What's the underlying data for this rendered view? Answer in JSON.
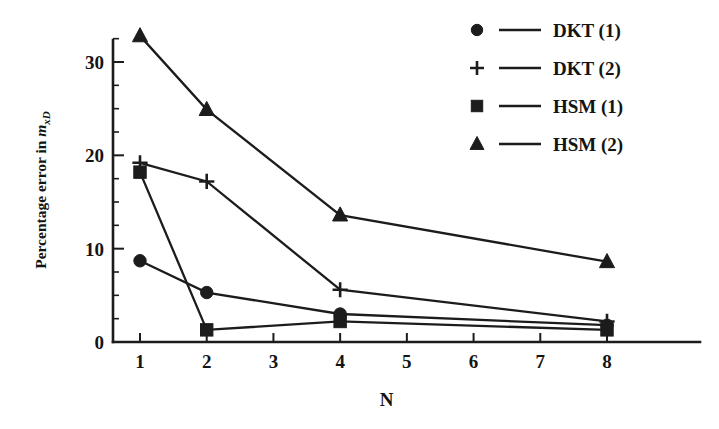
{
  "chart_data": {
    "type": "line",
    "title": "",
    "subtitle": "",
    "xlabel": "N",
    "ylabel": "Percentage error in m_xD",
    "ylabel_parts": {
      "prefix": "Percentage error in ",
      "symbol": "m",
      "subscript": "xD"
    },
    "x": [
      1,
      2,
      4,
      8
    ],
    "xlim": [
      0.6,
      8.75
    ],
    "ylim": [
      0,
      34
    ],
    "xticks": [
      1,
      2,
      3,
      4,
      5,
      6,
      7,
      8
    ],
    "xtick_labels": [
      "1",
      "2",
      "3",
      "4",
      "5",
      "6",
      "7",
      "8"
    ],
    "yticks": [
      0,
      10,
      20,
      30
    ],
    "ytick_labels": [
      "0",
      "10",
      "20",
      "30"
    ],
    "y_minor_ticks": [
      2.5,
      5,
      7.5,
      12.5,
      15,
      17.5,
      22.5,
      25,
      27.5,
      32.5
    ],
    "grid": false,
    "legend_position": "top-right",
    "series": [
      {
        "name": "DKT (1)",
        "marker": "circle",
        "x": [
          1,
          2,
          4,
          8
        ],
        "values": [
          8.7,
          5.3,
          3.0,
          1.8
        ]
      },
      {
        "name": "DKT (2)",
        "marker": "plus",
        "x": [
          1,
          2,
          4,
          8
        ],
        "values": [
          19.2,
          17.2,
          5.6,
          2.2
        ]
      },
      {
        "name": "HSM (1)",
        "marker": "square",
        "x": [
          1,
          2,
          4,
          8
        ],
        "values": [
          18.2,
          1.3,
          2.2,
          1.3
        ]
      },
      {
        "name": "HSM (2)",
        "marker": "triangle",
        "x": [
          1,
          2,
          4,
          8
        ],
        "values": [
          32.8,
          24.9,
          13.6,
          8.6
        ]
      }
    ]
  },
  "legend": {
    "entries": [
      {
        "label": "DKT (1)",
        "marker": "circle"
      },
      {
        "label": "DKT (2)",
        "marker": "plus"
      },
      {
        "label": "HSM (1)",
        "marker": "square"
      },
      {
        "label": "HSM (2)",
        "marker": "triangle"
      }
    ]
  }
}
